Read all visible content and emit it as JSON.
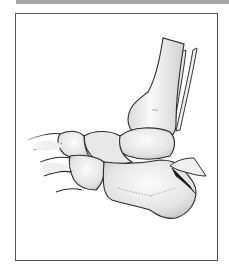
{
  "figure": {
    "colors": {
      "frame_border": "#555555",
      "top_rule": "#a8a8a8",
      "bone_fill": "#ececec",
      "bone_outline": "#2a2a2a",
      "fracture_shadow": "#1a1a1a"
    }
  }
}
